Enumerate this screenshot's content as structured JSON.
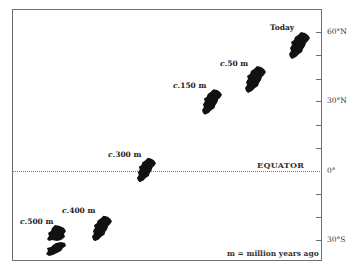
{
  "figure": {
    "title": "",
    "equator_label": "EQUATOR",
    "legend": "m = million years ago",
    "latitude_axis": {
      "ticks": [
        {
          "label": "60°N",
          "y": 32
        },
        {
          "label": "",
          "y": 55
        },
        {
          "label": "",
          "y": 79
        },
        {
          "label": "30°N",
          "y": 101
        },
        {
          "label": "",
          "y": 125
        },
        {
          "label": "",
          "y": 148
        },
        {
          "label": "0°",
          "y": 171
        },
        {
          "label": "",
          "y": 194
        },
        {
          "label": "",
          "y": 217
        },
        {
          "label": "30°S",
          "y": 240
        }
      ]
    },
    "positions": [
      {
        "prefix": "c.",
        "label": "500 m",
        "approx_latitude": "~35°S"
      },
      {
        "prefix": "c.",
        "label": "400 m",
        "approx_latitude": "~30°S"
      },
      {
        "prefix": "c.",
        "label": "300 m",
        "approx_latitude": "~0°"
      },
      {
        "prefix": "c.",
        "label": "150 m",
        "approx_latitude": "~30°N"
      },
      {
        "prefix": "c.",
        "label": "50 m",
        "approx_latitude": "~40°N"
      },
      {
        "prefix": "",
        "label": "Today",
        "approx_latitude": "~53°N"
      }
    ],
    "colors": {
      "landmass": "#111111",
      "axis": "#6f6f6f",
      "text": "#222222"
    }
  }
}
